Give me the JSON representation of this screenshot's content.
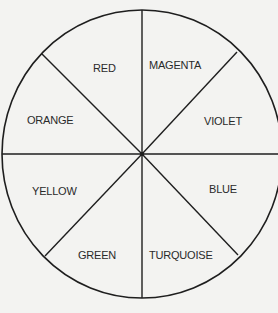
{
  "diagram": {
    "type": "color-wheel",
    "segments": [
      {
        "label": "RED",
        "x": 93,
        "y": 62
      },
      {
        "label": "MAGENTA",
        "x": 149,
        "y": 59
      },
      {
        "label": "VIOLET",
        "x": 204,
        "y": 115
      },
      {
        "label": "BLUE",
        "x": 209,
        "y": 183
      },
      {
        "label": "TURQUOISE",
        "x": 149,
        "y": 249
      },
      {
        "label": "GREEN",
        "x": 78,
        "y": 249
      },
      {
        "label": "YELLOW",
        "x": 32,
        "y": 185
      },
      {
        "label": "ORANGE",
        "x": 27,
        "y": 114
      }
    ],
    "line_color": "#1e1e1e",
    "background": "#f3f3f1"
  }
}
